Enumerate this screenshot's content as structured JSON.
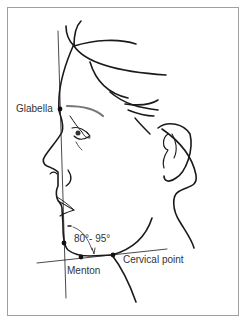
{
  "figure": {
    "labels": {
      "glabella": "Glabella",
      "angle": "80°- 95°",
      "menton": "Menton",
      "cervical_point": "Cervical point"
    },
    "colors": {
      "line": "#1a1a1a",
      "frame": "#a0a0a0",
      "text": "#333333"
    }
  }
}
